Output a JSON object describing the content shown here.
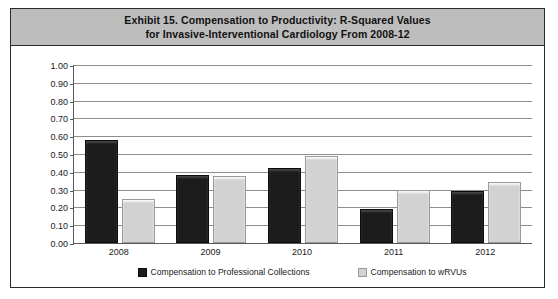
{
  "figure": {
    "title_line1": "Exhibit 15. Compensation to Productivity: R-Squared Values",
    "title_line2": "for Invasive-Interventional Cardiology From 2008-12",
    "title_band_color": "#bdbdbd",
    "frame_border_color": "#2b2b2b"
  },
  "chart_data": {
    "type": "bar",
    "title": "Exhibit 15. Compensation to Productivity: R-Squared Values for Invasive-Interventional Cardiology From 2008-12",
    "xlabel": "",
    "ylabel": "",
    "categories": [
      "2008",
      "2009",
      "2010",
      "2011",
      "2012"
    ],
    "series": [
      {
        "name": "Compensation to Professional Collections",
        "color": "#1c1c1c",
        "values": [
          0.58,
          0.38,
          0.42,
          0.19,
          0.29
        ]
      },
      {
        "name": "Compensation to wRVUs",
        "color": "#d2d2d2",
        "values": [
          0.25,
          0.375,
          0.49,
          0.3,
          0.345
        ]
      }
    ],
    "ylim": [
      0.0,
      1.0
    ],
    "ytick_values": [
      1.0,
      0.9,
      0.8,
      0.7,
      0.6,
      0.5,
      0.4,
      0.3,
      0.2,
      0.1,
      0.0
    ],
    "ytick_labels": [
      "1.00",
      "0.90",
      "0.80",
      "0.70",
      "0.60",
      "0.50",
      "0.40",
      "0.30",
      "0.20",
      "0.10",
      "0.00"
    ],
    "grid": true,
    "grid_axis": "y",
    "legend_position": "bottom"
  }
}
